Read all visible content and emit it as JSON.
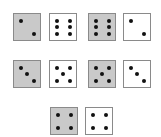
{
  "colors": {
    "gray_face": "#c9c9c9",
    "white_face": "#ffffff",
    "border": "#8a8a8a",
    "pip": "#111111"
  },
  "rows": [
    [
      {
        "color": "gray",
        "value": 2
      },
      {
        "color": "white",
        "value": 6
      },
      {
        "color": "gray",
        "value": 6
      },
      {
        "color": "white",
        "value": 2
      }
    ],
    [
      {
        "color": "gray",
        "value": 3
      },
      {
        "color": "white",
        "value": 5
      },
      {
        "color": "gray",
        "value": 5
      },
      {
        "color": "white",
        "value": 3
      }
    ],
    [
      {
        "color": "gray",
        "value": 4
      },
      {
        "color": "white",
        "value": 4
      }
    ]
  ]
}
